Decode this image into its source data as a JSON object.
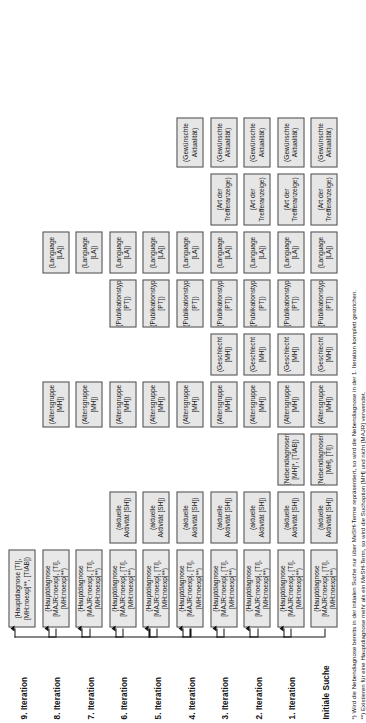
{
  "figure": {
    "title_present": false,
    "orientation": "rotated-90-ccw",
    "row_label_header": "",
    "rows": [
      {
        "label": "9. Iteration",
        "boxes": [
          "(Hauptdiagnose [TI], [MH:noexp]**, [TIAB])"
        ]
      },
      {
        "label": "8. Iteration",
        "boxes": [
          "(Hauptdiagnose [MAJR:noexp], [TI], [MH:noexp]**)",
          "(Altersgruppe [MH])",
          "(Language [LA])"
        ]
      },
      {
        "label": "7. Iteration",
        "boxes": [
          "(Hauptdiagnose [MAJR:noexp], [TI], [MH:noexp]**)",
          "(Altersgruppe [MH])",
          "(Language [LA])"
        ]
      },
      {
        "label": "6. Iteration",
        "boxes": [
          "(Hauptdiagnose [MAJR:noexp], [TI], [MH:noexp]**)",
          "(aktuelle Aktivität [SH])",
          "(Altersgruppe [MH])",
          "(Publikationstyp [PT])",
          "(Language [LA])"
        ]
      },
      {
        "label": "5. Iteration",
        "boxes": [
          "(Hauptdiagnose [MAJR:noexp], [TI], [MH:noexp]**)",
          "(aktuelle Aktivität [SH])",
          "(Altersgruppe [MH])",
          "(Publikationstyp [PT])",
          "(Language [LA])"
        ]
      },
      {
        "label": "4. Iteration",
        "boxes": [
          "(Hauptdiagnose [MAJR:noexp], [TI], [MH:noexp]**)",
          "(aktuelle Aktivität [SH])",
          "(Altersgruppe [MH])",
          "(Publikationstyp [PT])",
          "(Language [LA])",
          "(Gewünschte Aktualität)"
        ]
      },
      {
        "label": "3. Iteration",
        "boxes": [
          "(Hauptdiagnose [MAJR:noexp], [TI], [MH:noexp]**)",
          "(aktuelle Aktivität [SH])",
          "(Altersgruppe [MH])",
          "(Geschlecht [MH])",
          "(Publikationstyp [PT])",
          "(Language [LA])",
          "(Art der Trefferanzeige)",
          "(Gewünschte Aktualität)"
        ]
      },
      {
        "label": "2. Iteration",
        "boxes": [
          "(Hauptdiagnose [MAJR:noexp], [TI], [MH:noexp]**)",
          "(aktuelle Aktivität [SH])",
          "(Altersgruppe [MH])",
          "(Geschlecht [MH])",
          "(Publikationstyp [PT])",
          "(Language [LA])",
          "(Art der Trefferanzeige)",
          "(Gewünschte Aktualität)"
        ]
      },
      {
        "label": "1. Iteration",
        "boxes": [
          "(Hauptdiagnose [MAJR:noexp], [TI], [MH:noexp]**)",
          "(aktuelle Aktivität [SH])",
          "(Nebendiagnosen [MH]*, [TIAB])",
          "(Altersgruppe [MH])",
          "(Geschlecht [MH])",
          "(Publikationstyp [PT])",
          "(Language [LA])",
          "(Art der Trefferanzeige)",
          "(Gewünschte Aktualität)"
        ]
      },
      {
        "label": "Initiale Suche",
        "boxes": [
          "(Hauptdiagnose [MAJR:noexp], [TI], [MH:noexp]**)",
          "(aktuelle Aktivität [SH])",
          "(Nebendiagnosen [MH], [TI])",
          "(Altersgruppe [MH])",
          "(Geschlecht [MH])",
          "(Publikationstyp [PT])",
          "(Language [LA])",
          "(Art der Trefferanzeige)",
          "(Gewünschte Aktualität)"
        ]
      }
    ],
    "footnotes": [
      "*) Wird die Nebendiagnose bereits in der initialen Suche nur über MeSH-Terme repräsentiert, so wird die Nebendiagnose in der 1. Iteration komplett gestrichen.",
      "**) Existieren für eine Hauptdiagnose mehr als ein MeSH-Term, so wird die Suchoption [MH] und nicht [MAJR] verwendet."
    ]
  },
  "colors": {
    "box_fill": "#e6e6e6",
    "box_border": "#4d4d4d",
    "text": "#1a1a1a",
    "arrow": "#111111",
    "background": "#ffffff"
  }
}
